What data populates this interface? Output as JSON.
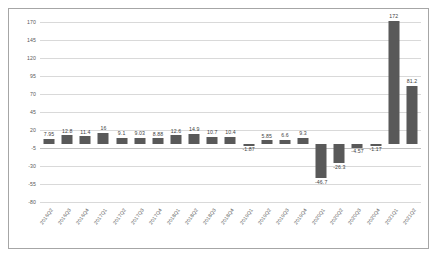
{
  "chart_data": {
    "type": "bar",
    "title": "",
    "subtitle": "",
    "xlabel": "",
    "ylabel": "",
    "grid": true,
    "legend": "none",
    "ylim": [
      -80,
      170
    ],
    "yticks": [
      170,
      145,
      120,
      95,
      70,
      45,
      20,
      -5,
      -30,
      -55,
      -80
    ],
    "categories": [
      "2016Q2",
      "2016Q3",
      "2016Q4",
      "2017Q1",
      "2017Q2",
      "2017Q3",
      "2017Q4",
      "2018Q1",
      "2018Q2",
      "2018Q3",
      "2018Q4",
      "2019Q1",
      "2019Q2",
      "2019Q3",
      "2019Q4",
      "2020Q1",
      "2020Q2",
      "2020Q3",
      "2020Q4",
      "2021Q1",
      "2021Q2"
    ],
    "values": [
      7.95,
      12.8,
      11.4,
      16,
      9.1,
      9.03,
      8.88,
      12.6,
      14.9,
      10.7,
      10.4,
      -1.87,
      5.85,
      6.6,
      9.3,
      -46.7,
      -26.3,
      -4.57,
      -1.17,
      172,
      81.2
    ],
    "value_labels": [
      "7.95",
      "12.8",
      "11.4",
      "16",
      "9.1",
      "9.03",
      "8.88",
      "12.6",
      "14.9",
      "10.7",
      "10.4",
      "-1.87",
      "5.85",
      "6.6",
      "9.3",
      "-46.7",
      "-26.3",
      "-4.57",
      "-1.17",
      "172",
      "81.2"
    ],
    "series_name": "",
    "bar_color": "#595959",
    "gridline_color": "#d9d9d9",
    "axis_text_color": "#595959",
    "plot_background": "#ffffff",
    "border_color": "#a6a6a6"
  }
}
